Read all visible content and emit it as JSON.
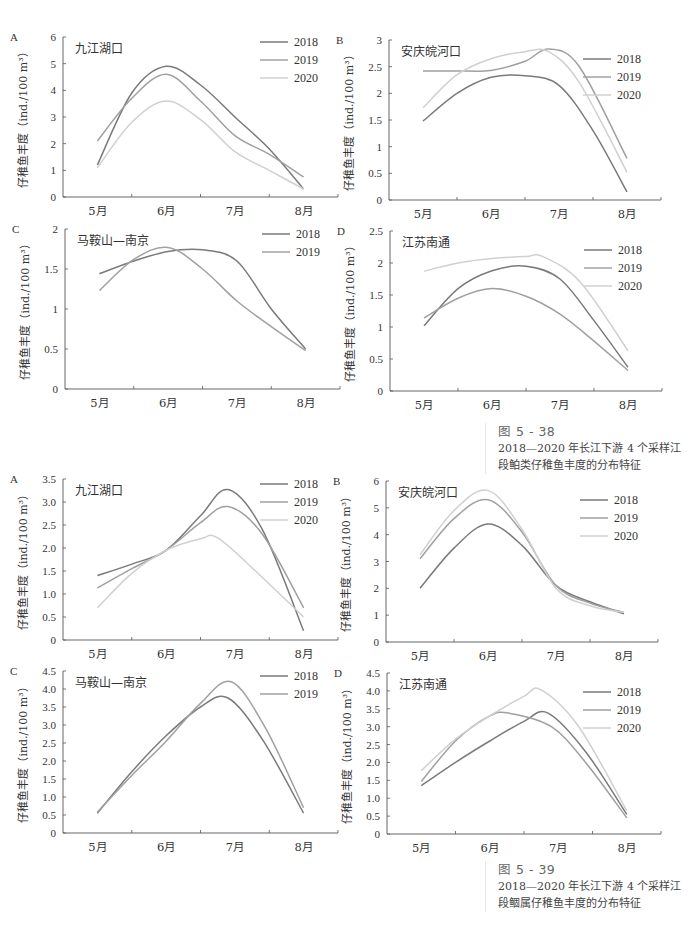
{
  "figures": [
    {
      "id": "fig-5-38",
      "caption": {
        "number": "图 5 - 38",
        "text_line1": "2018—2020 年长江下游 4 个采样江",
        "text_line2": "段鲌类仔稚鱼丰度的分布特征"
      }
    },
    {
      "id": "fig-5-39",
      "caption": {
        "number": "图 5 - 39",
        "text_line1": "2018—2020 年长江下游 4 个采样江",
        "text_line2": "段鲴属仔稚鱼丰度的分布特征"
      }
    }
  ],
  "series_colors": {
    "2018": "#7a7a7a",
    "2019": "#a0a0a0",
    "2020": "#d0d0d0"
  },
  "chart_data": [
    {
      "figure": "图 5-38",
      "panel": "A",
      "title": "九江湖口",
      "type": "line",
      "ylabel": "仔稚鱼丰度（ind./100 m³）",
      "xlabel": "",
      "categories": [
        "5月",
        "6月",
        "7月",
        "8月"
      ],
      "ylim": [
        0,
        6
      ],
      "yticks": [
        "0",
        "1",
        "2",
        "3",
        "4",
        "5",
        "6"
      ],
      "legend_position": "top-right",
      "grid": false,
      "box": {
        "left": 63,
        "top": 37,
        "width": 275,
        "height": 160
      },
      "series": [
        {
          "name": "2018",
          "points": [
            [
              0,
              1.2
            ],
            [
              0.5,
              3.9
            ],
            [
              1,
              4.9
            ],
            [
              1.5,
              4.2
            ],
            [
              2,
              3.0
            ],
            [
              2.5,
              1.8
            ],
            [
              3,
              0.3
            ]
          ]
        },
        {
          "name": "2019",
          "points": [
            [
              0,
              2.1
            ],
            [
              0.5,
              3.7
            ],
            [
              1,
              4.6
            ],
            [
              1.5,
              3.6
            ],
            [
              2,
              2.3
            ],
            [
              2.5,
              1.6
            ],
            [
              3,
              0.75
            ]
          ]
        },
        {
          "name": "2020",
          "points": [
            [
              0,
              1.1
            ],
            [
              0.5,
              2.8
            ],
            [
              1,
              3.6
            ],
            [
              1.5,
              2.9
            ],
            [
              2,
              1.7
            ],
            [
              2.5,
              1.0
            ],
            [
              3,
              0.3
            ]
          ]
        }
      ]
    },
    {
      "figure": "图 5-38",
      "panel": "B",
      "title": "安庆皖河口",
      "type": "line",
      "ylabel": "仔稚鱼丰度（ind./100 m³）",
      "xlabel": "",
      "categories": [
        "5月",
        "6月",
        "7月",
        "8月"
      ],
      "ylim": [
        0,
        3
      ],
      "yticks": [
        "0",
        "0.5",
        "1",
        "1.5",
        "2",
        "2.5",
        "3"
      ],
      "legend_position": "right",
      "grid": false,
      "box": {
        "left": 389,
        "top": 40,
        "width": 272,
        "height": 160
      },
      "series": [
        {
          "name": "2018",
          "points": [
            [
              0,
              1.48
            ],
            [
              0.5,
              2.0
            ],
            [
              1,
              2.3
            ],
            [
              1.5,
              2.33
            ],
            [
              2,
              2.15
            ],
            [
              2.5,
              1.3
            ],
            [
              3,
              0.15
            ]
          ]
        },
        {
          "name": "2019",
          "points": [
            [
              0,
              2.42
            ],
            [
              0.5,
              2.42
            ],
            [
              1,
              2.43
            ],
            [
              1.5,
              2.6
            ],
            [
              1.85,
              2.83
            ],
            [
              2.3,
              2.5
            ],
            [
              3,
              0.78
            ]
          ]
        },
        {
          "name": "2020",
          "points": [
            [
              0,
              1.73
            ],
            [
              0.5,
              2.35
            ],
            [
              1,
              2.65
            ],
            [
              1.5,
              2.78
            ],
            [
              1.85,
              2.78
            ],
            [
              2.3,
              2.2
            ],
            [
              3,
              0.52
            ]
          ]
        }
      ]
    },
    {
      "figure": "图 5-38",
      "panel": "C",
      "title": "马鞍山—南京",
      "type": "line",
      "ylabel": "仔稚鱼丰度（ind./100 m³）",
      "xlabel": "",
      "categories": [
        "5月",
        "6月",
        "7月",
        "8月"
      ],
      "ylim": [
        0,
        2
      ],
      "yticks": [
        "0",
        "0.5",
        "1",
        "1.5",
        "2"
      ],
      "legend_position": "top-right",
      "grid": false,
      "box": {
        "left": 65,
        "top": 229,
        "width": 275,
        "height": 160
      },
      "series": [
        {
          "name": "2018",
          "points": [
            [
              0,
              1.44
            ],
            [
              0.5,
              1.6
            ],
            [
              1,
              1.72
            ],
            [
              1.5,
              1.74
            ],
            [
              2,
              1.6
            ],
            [
              2.5,
              1.0
            ],
            [
              3,
              0.5
            ]
          ]
        },
        {
          "name": "2019",
          "points": [
            [
              0,
              1.23
            ],
            [
              0.5,
              1.62
            ],
            [
              1,
              1.77
            ],
            [
              1.5,
              1.5
            ],
            [
              2,
              1.1
            ],
            [
              2.5,
              0.78
            ],
            [
              3,
              0.48
            ]
          ]
        }
      ]
    },
    {
      "figure": "图 5-38",
      "panel": "D",
      "title": "江苏南通",
      "type": "line",
      "ylabel": "仔稚鱼丰度（ind./100 m³）",
      "xlabel": "",
      "categories": [
        "5月",
        "6月",
        "7月",
        "8月"
      ],
      "ylim": [
        0,
        2.5
      ],
      "yticks": [
        "0",
        "0.5",
        "1",
        "1.5",
        "2",
        "2.5"
      ],
      "legend_position": "right",
      "grid": false,
      "box": {
        "left": 390,
        "top": 231,
        "width": 272,
        "height": 160
      },
      "series": [
        {
          "name": "2018",
          "points": [
            [
              0,
              1.02
            ],
            [
              0.5,
              1.6
            ],
            [
              1,
              1.88
            ],
            [
              1.5,
              1.95
            ],
            [
              2,
              1.75
            ],
            [
              2.5,
              1.1
            ],
            [
              3,
              0.37
            ]
          ]
        },
        {
          "name": "2019",
          "points": [
            [
              0,
              1.14
            ],
            [
              0.5,
              1.45
            ],
            [
              1,
              1.6
            ],
            [
              1.5,
              1.48
            ],
            [
              2,
              1.2
            ],
            [
              2.5,
              0.78
            ],
            [
              3,
              0.32
            ]
          ]
        },
        {
          "name": "2020",
          "points": [
            [
              0,
              1.87
            ],
            [
              0.5,
              2.0
            ],
            [
              1,
              2.07
            ],
            [
              1.5,
              2.1
            ],
            [
              1.75,
              2.1
            ],
            [
              2.3,
              1.7
            ],
            [
              3,
              0.63
            ]
          ]
        }
      ]
    },
    {
      "figure": "图 5-39",
      "panel": "A",
      "title": "九江湖口",
      "type": "line",
      "ylabel": "仔稚鱼丰度（ind./100 m³）",
      "xlabel": "",
      "categories": [
        "5月",
        "6月",
        "7月",
        "8月"
      ],
      "ylim": [
        0,
        3.5
      ],
      "yticks": [
        "0",
        "0.5",
        "1.0",
        "1.5",
        "2.0",
        "2.5",
        "3.0",
        "3.5"
      ],
      "legend_position": "top-right",
      "grid": false,
      "box": {
        "left": 63,
        "top": 479,
        "width": 275,
        "height": 161
      },
      "series": [
        {
          "name": "2018",
          "points": [
            [
              0,
              1.4
            ],
            [
              0.5,
              1.65
            ],
            [
              1,
              1.95
            ],
            [
              1.5,
              2.7
            ],
            [
              1.9,
              3.27
            ],
            [
              2.4,
              2.4
            ],
            [
              3,
              0.2
            ]
          ]
        },
        {
          "name": "2019",
          "points": [
            [
              0,
              1.13
            ],
            [
              0.5,
              1.55
            ],
            [
              1,
              1.95
            ],
            [
              1.5,
              2.55
            ],
            [
              1.9,
              2.9
            ],
            [
              2.4,
              2.3
            ],
            [
              3,
              0.7
            ]
          ]
        },
        {
          "name": "2020",
          "points": [
            [
              0,
              0.7
            ],
            [
              0.5,
              1.45
            ],
            [
              1,
              1.95
            ],
            [
              1.5,
              2.2
            ],
            [
              1.75,
              2.22
            ],
            [
              2.3,
              1.5
            ],
            [
              3,
              0.5
            ]
          ]
        }
      ]
    },
    {
      "figure": "图 5-39",
      "panel": "B",
      "title": "安庆皖河口",
      "type": "line",
      "ylabel": "仔稚鱼丰度（ind./100 m³）",
      "xlabel": "",
      "categories": [
        "5月",
        "6月",
        "7月",
        "8月"
      ],
      "ylim": [
        0,
        6
      ],
      "yticks": [
        "0",
        "1",
        "2",
        "3",
        "4",
        "5",
        "6"
      ],
      "legend_position": "right",
      "grid": false,
      "box": {
        "left": 386,
        "top": 481,
        "width": 272,
        "height": 161
      },
      "series": [
        {
          "name": "2018",
          "points": [
            [
              0,
              2.0
            ],
            [
              0.5,
              3.5
            ],
            [
              1,
              4.4
            ],
            [
              1.5,
              3.6
            ],
            [
              2,
              2.1
            ],
            [
              2.5,
              1.5
            ],
            [
              3,
              1.05
            ]
          ]
        },
        {
          "name": "2019",
          "points": [
            [
              0,
              3.1
            ],
            [
              0.5,
              4.6
            ],
            [
              1,
              5.3
            ],
            [
              1.5,
              4.1
            ],
            [
              2,
              2.1
            ],
            [
              2.5,
              1.45
            ],
            [
              3,
              1.1
            ]
          ]
        },
        {
          "name": "2020",
          "points": [
            [
              0,
              3.25
            ],
            [
              0.5,
              4.9
            ],
            [
              1,
              5.65
            ],
            [
              1.5,
              4.2
            ],
            [
              2,
              2.0
            ],
            [
              2.5,
              1.35
            ],
            [
              3,
              1.1
            ]
          ]
        }
      ]
    },
    {
      "figure": "图 5-39",
      "panel": "C",
      "title": "马鞍山—南京",
      "type": "line",
      "ylabel": "仔稚鱼丰度（ind./100 m³）",
      "xlabel": "",
      "categories": [
        "5月",
        "6月",
        "7月",
        "8月"
      ],
      "ylim": [
        0,
        4.5
      ],
      "yticks": [
        "0",
        "0.5",
        "1.0",
        "1.5",
        "2.0",
        "2.5",
        "3.0",
        "3.5",
        "4.0",
        "4.5"
      ],
      "legend_position": "top-right",
      "grid": false,
      "box": {
        "left": 63,
        "top": 671,
        "width": 275,
        "height": 162
      },
      "series": [
        {
          "name": "2018",
          "points": [
            [
              0,
              0.55
            ],
            [
              0.5,
              1.7
            ],
            [
              1,
              2.7
            ],
            [
              1.5,
              3.5
            ],
            [
              1.9,
              3.75
            ],
            [
              2.4,
              2.6
            ],
            [
              3,
              0.55
            ]
          ]
        },
        {
          "name": "2019",
          "points": [
            [
              0,
              0.58
            ],
            [
              0.5,
              1.6
            ],
            [
              1,
              2.55
            ],
            [
              1.5,
              3.6
            ],
            [
              1.95,
              4.2
            ],
            [
              2.45,
              2.9
            ],
            [
              3,
              0.7
            ]
          ]
        }
      ]
    },
    {
      "figure": "图 5-39",
      "panel": "D",
      "title": "江苏南通",
      "type": "line",
      "ylabel": "仔稚鱼丰度（ind./100 m³）",
      "xlabel": "",
      "categories": [
        "5月",
        "6月",
        "7月",
        "8月"
      ],
      "ylim": [
        0,
        4.5
      ],
      "yticks": [
        "0",
        "0.5",
        "1.0",
        "1.5",
        "2.0",
        "2.5",
        "3.0",
        "3.5",
        "4.0",
        "4.5"
      ],
      "legend_position": "right",
      "grid": false,
      "box": {
        "left": 387,
        "top": 673,
        "width": 274,
        "height": 161
      },
      "series": [
        {
          "name": "2018",
          "points": [
            [
              0,
              1.35
            ],
            [
              0.5,
              2.0
            ],
            [
              1,
              2.6
            ],
            [
              1.5,
              3.15
            ],
            [
              1.85,
              3.38
            ],
            [
              2.4,
              2.3
            ],
            [
              3,
              0.55
            ]
          ]
        },
        {
          "name": "2019",
          "points": [
            [
              0,
              1.47
            ],
            [
              0.5,
              2.6
            ],
            [
              1,
              3.3
            ],
            [
              1.3,
              3.37
            ],
            [
              1.9,
              3.0
            ],
            [
              2.4,
              2.0
            ],
            [
              3,
              0.45
            ]
          ]
        },
        {
          "name": "2020",
          "points": [
            [
              0,
              1.77
            ],
            [
              0.5,
              2.65
            ],
            [
              1,
              3.3
            ],
            [
              1.5,
              3.85
            ],
            [
              1.75,
              4.03
            ],
            [
              2.3,
              3.0
            ],
            [
              3,
              0.65
            ]
          ]
        }
      ]
    }
  ]
}
